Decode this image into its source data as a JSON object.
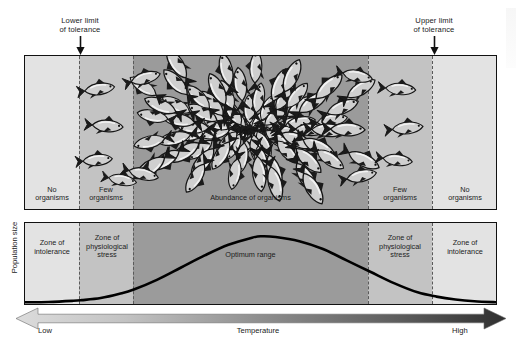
{
  "figure": {
    "title_hidden": "",
    "callouts": [
      {
        "id": "lower-limit",
        "line1": "Lower limit",
        "line2": "of tolerance",
        "x": 80
      },
      {
        "id": "upper-limit",
        "line1": "Upper limit",
        "line2": "of tolerance",
        "x": 434
      }
    ],
    "axis": {
      "y_label": "Population size",
      "x_label": "Temperature",
      "x_low": "Low",
      "x_high": "High"
    },
    "top_panel": {
      "labels": [
        {
          "id": "no-organisms-left",
          "line1": "No",
          "line2": "organisms"
        },
        {
          "id": "few-organisms-left",
          "line1": "Few",
          "line2": "organisms"
        },
        {
          "id": "abundance",
          "line1": "Abundance of organisms",
          "line2": ""
        },
        {
          "id": "few-organisms-right",
          "line1": "Few",
          "line2": "organisms"
        },
        {
          "id": "no-organisms-right",
          "line1": "No",
          "line2": "organisms"
        }
      ]
    },
    "bottom_panel": {
      "labels": [
        {
          "id": "zone-intolerance-left",
          "line1": "Zone of",
          "line2": "intolerance",
          "line3": ""
        },
        {
          "id": "zone-physio-left",
          "line1": "Zone of",
          "line2": "physiological",
          "line3": "stress"
        },
        {
          "id": "optimum-range",
          "line1": "Optimum range",
          "line2": "",
          "line3": ""
        },
        {
          "id": "zone-physio-right",
          "line1": "Zone of",
          "line2": "physiological",
          "line3": "stress"
        },
        {
          "id": "zone-intolerance-right",
          "line1": "Zone of",
          "line2": "intolerance",
          "line3": ""
        }
      ]
    },
    "colors": {
      "zone_outer": "#e2e2e2",
      "zone_mid": "#c2c2c2",
      "zone_core": "#9a9a9a",
      "border": "#111111",
      "dash": "#5a5a5a",
      "curve": "#000000",
      "gradient_light": "#d8d8d8",
      "gradient_dark": "#3a3a3a",
      "fish_body": "#c9c9c9",
      "fish_outline": "#1b1b1b"
    }
  },
  "chart_data": {
    "type": "area",
    "xlabel": "Temperature",
    "ylabel": "Population size",
    "xlim": [
      0,
      100
    ],
    "ylim": [
      0,
      100
    ],
    "grid": false,
    "legend": "none",
    "x_tick_labels": [
      "Low",
      "High"
    ],
    "annotations": [
      {
        "text": "Lower limit of tolerance",
        "x": 12
      },
      {
        "text": "Upper limit of tolerance",
        "x": 87
      }
    ],
    "zones": [
      {
        "name": "Zone of intolerance",
        "x_start": 0,
        "x_end": 12,
        "shade": "#e2e2e2",
        "organisms": "No organisms"
      },
      {
        "name": "Zone of physiological stress",
        "x_start": 12,
        "x_end": 23,
        "shade": "#c2c2c2",
        "organisms": "Few organisms"
      },
      {
        "name": "Optimum range",
        "x_start": 23,
        "x_end": 73,
        "shade": "#9a9a9a",
        "organisms": "Abundance of organisms"
      },
      {
        "name": "Zone of physiological stress",
        "x_start": 73,
        "x_end": 87,
        "shade": "#c2c2c2",
        "organisms": "Few organisms"
      },
      {
        "name": "Zone of intolerance",
        "x_start": 87,
        "x_end": 100,
        "shade": "#e2e2e2",
        "organisms": "No organisms"
      }
    ],
    "series": [
      {
        "name": "Population size",
        "x": [
          0,
          5,
          10,
          12,
          16,
          20,
          23,
          28,
          33,
          38,
          43,
          48,
          50,
          53,
          58,
          63,
          68,
          73,
          78,
          83,
          87,
          91,
          95,
          100
        ],
        "values": [
          1,
          1.5,
          3,
          4,
          7,
          13,
          19,
          33,
          50,
          67,
          82,
          92,
          94,
          93,
          87,
          76,
          60,
          44,
          28,
          15,
          9,
          5,
          2.5,
          1
        ]
      }
    ]
  }
}
